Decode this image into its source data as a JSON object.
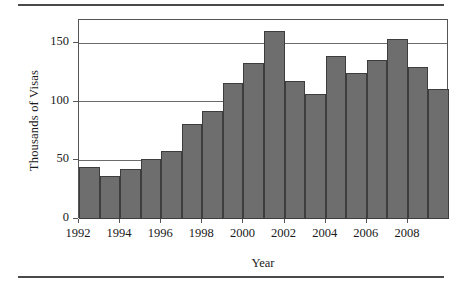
{
  "figure": {
    "ylabel": "Thousands of Visas",
    "xlabel": "Year",
    "bar_color": "#6e6e6e",
    "bar_edge_color": "#3d3d3d",
    "axis_color": "#555555"
  },
  "chart_data": {
    "type": "bar",
    "title": "",
    "xlabel": "Year",
    "ylabel": "Thousands of Visas",
    "categories": [
      "1992",
      "1993",
      "1994",
      "1995",
      "1996",
      "1997",
      "1998",
      "1999",
      "2000",
      "2001",
      "2002",
      "2003",
      "2004",
      "2005",
      "2006",
      "2007",
      "2008",
      "2009"
    ],
    "values": [
      44,
      37,
      43,
      51,
      58,
      81,
      92,
      116,
      133,
      161,
      118,
      107,
      139,
      125,
      136,
      154,
      130,
      111
    ],
    "ylim": [
      0,
      170
    ],
    "yticks": [
      0,
      50,
      100,
      150
    ],
    "ytick_labels": [
      "0",
      "50",
      "100",
      "150"
    ],
    "xticks": [
      "1992",
      "1994",
      "1996",
      "1998",
      "2000",
      "2002",
      "2004",
      "2006",
      "2008"
    ],
    "grid": "horizontal",
    "legend": "none"
  }
}
